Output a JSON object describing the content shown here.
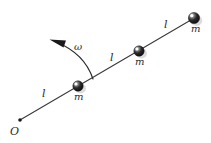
{
  "figure": {
    "kind": "physics-diagram",
    "background_color": "#ffffff",
    "ink_color": "#2b2b2b",
    "rod": {
      "from_label": "O",
      "start": [
        20,
        120
      ],
      "end": [
        196,
        17
      ],
      "stroke_color": "#3a3a3a",
      "stroke_width": 1.1
    },
    "origin": {
      "label": "O",
      "dot_x": 20,
      "dot_y": 120,
      "dot_radius": 1.8,
      "label_x": 10,
      "label_y": 126
    },
    "masses": [
      {
        "label": "m",
        "cx": 78,
        "cy": 86,
        "r": 5.2,
        "label_x": 74,
        "label_y": 92
      },
      {
        "label": "m",
        "cx": 139,
        "cy": 51,
        "r": 5.2,
        "label_x": 135,
        "label_y": 57
      },
      {
        "label": "m",
        "cx": 194,
        "cy": 18,
        "r": 5.6,
        "label_x": 191,
        "label_y": 24
      }
    ],
    "segment_labels": [
      {
        "text": "l",
        "x": 42,
        "y": 88
      },
      {
        "text": "l",
        "x": 110,
        "y": 52
      },
      {
        "text": "l",
        "x": 164,
        "y": 19
      }
    ],
    "angular_velocity": {
      "symbol": "ω",
      "label_x": 74,
      "label_y": 42,
      "arc_path": "M 93 79 C 88 64, 76 50, 56 42",
      "arrow_tip": [
        50,
        40
      ],
      "arrow_points": "50,40 66,40 64,47",
      "stroke_color": "#2b2b2b",
      "stroke_width": 1.2
    },
    "ball_style": {
      "fill_color": "#1a1a1a",
      "highlight_color": "#ffffff",
      "halo_color": "#d6d6d6"
    }
  }
}
